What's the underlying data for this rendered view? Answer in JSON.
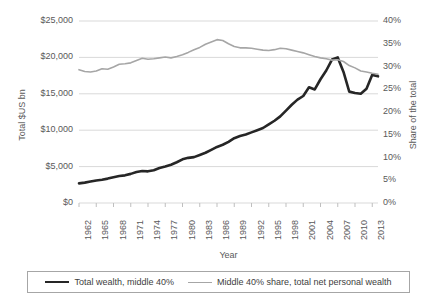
{
  "chart_data": {
    "type": "line",
    "title": "",
    "xlabel": "Year",
    "ylabel_left": "Total $US bn",
    "ylabel_right": "Share of the total",
    "grid": true,
    "legend_position": "bottom",
    "xlim": [
      1962,
      2014
    ],
    "ylim_left": [
      0,
      25000
    ],
    "ylim_right": [
      0,
      0.4
    ],
    "ytick_labels_left": [
      "$25,000",
      "$20,000",
      "$15,000",
      "$10,000",
      "$5,000",
      "$0"
    ],
    "ytick_values_left": [
      25000,
      20000,
      15000,
      10000,
      5000,
      0
    ],
    "ytick_labels_right": [
      "40%",
      "35%",
      "30%",
      "25%",
      "20%",
      "15%",
      "10%",
      "5%",
      "0%"
    ],
    "ytick_values_right": [
      0.4,
      0.35,
      0.3,
      0.25,
      0.2,
      0.15,
      0.1,
      0.05,
      0.0
    ],
    "xtick_labels": [
      "1962",
      "1965",
      "1968",
      "1971",
      "1974",
      "1977",
      "1980",
      "1983",
      "1986",
      "1989",
      "1992",
      "1995",
      "1998",
      "2001",
      "2004",
      "2007",
      "2010",
      "2013"
    ],
    "xtick_values": [
      1962,
      1965,
      1968,
      1971,
      1974,
      1977,
      1980,
      1983,
      1986,
      1989,
      1992,
      1995,
      1998,
      2001,
      2004,
      2007,
      2010,
      2013
    ],
    "x": [
      1962,
      1963,
      1964,
      1965,
      1966,
      1967,
      1968,
      1969,
      1970,
      1971,
      1972,
      1973,
      1974,
      1975,
      1976,
      1977,
      1978,
      1979,
      1980,
      1981,
      1982,
      1983,
      1984,
      1985,
      1986,
      1987,
      1988,
      1989,
      1990,
      1991,
      1992,
      1993,
      1994,
      1995,
      1996,
      1997,
      1998,
      1999,
      2000,
      2001,
      2002,
      2003,
      2004,
      2005,
      2006,
      2007,
      2008,
      2009,
      2010,
      2011,
      2012,
      2013,
      2014
    ],
    "series": [
      {
        "name": "Total wealth, middle 40%",
        "axis": "left",
        "color": "#262626",
        "unit": "$US bn",
        "values": [
          2700,
          2800,
          2950,
          3100,
          3200,
          3350,
          3550,
          3700,
          3800,
          4000,
          4250,
          4400,
          4350,
          4500,
          4800,
          5000,
          5250,
          5600,
          6000,
          6200,
          6300,
          6600,
          6900,
          7300,
          7700,
          8000,
          8400,
          8900,
          9200,
          9400,
          9700,
          10000,
          10300,
          10800,
          11300,
          11900,
          12700,
          13500,
          14200,
          14700,
          15900,
          15600,
          17000,
          18200,
          19700,
          20000,
          18000,
          15300,
          15100,
          15000,
          15700,
          17600,
          17400
        ]
      },
      {
        "name": "Middle 40% share, total net personal wealth",
        "axis": "right",
        "color": "#a6a6a6",
        "unit": "share",
        "values": [
          0.293,
          0.289,
          0.288,
          0.29,
          0.295,
          0.294,
          0.299,
          0.305,
          0.306,
          0.308,
          0.313,
          0.318,
          0.316,
          0.317,
          0.319,
          0.321,
          0.319,
          0.322,
          0.326,
          0.331,
          0.337,
          0.342,
          0.349,
          0.354,
          0.359,
          0.357,
          0.35,
          0.344,
          0.341,
          0.341,
          0.34,
          0.338,
          0.336,
          0.335,
          0.337,
          0.34,
          0.339,
          0.336,
          0.333,
          0.33,
          0.326,
          0.322,
          0.319,
          0.317,
          0.314,
          0.315,
          0.311,
          0.302,
          0.297,
          0.29,
          0.288,
          0.285,
          0.283
        ]
      }
    ]
  },
  "legend": {
    "entries": [
      {
        "label": "Total wealth, middle 40%",
        "color": "#262626",
        "style": "thick"
      },
      {
        "label": "Middle 40% share, total net personal wealth",
        "color": "#a6a6a6",
        "style": "thin"
      }
    ]
  },
  "colors": {
    "series_black": "#262626",
    "series_gray": "#a6a6a6",
    "gridline": "#d9d9d9",
    "text": "#595959"
  }
}
